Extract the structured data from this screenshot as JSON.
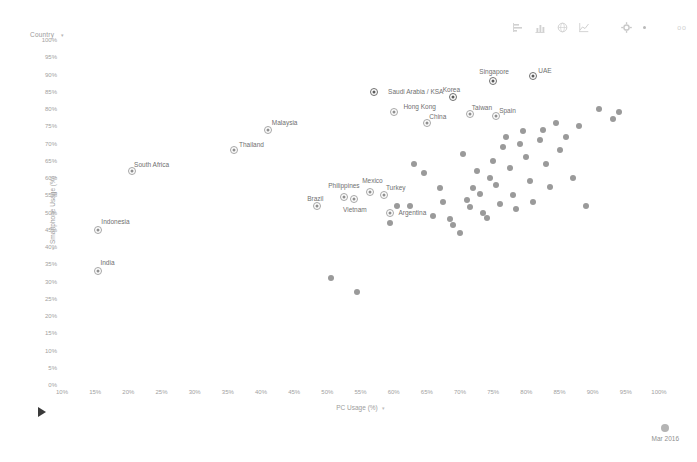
{
  "selector": {
    "label": "Country",
    "caret": "▾"
  },
  "toolbar": {
    "icons": [
      {
        "name": "bar-chart-icon",
        "glyph": "bar"
      },
      {
        "name": "column-chart-icon",
        "glyph": "column"
      },
      {
        "name": "globe-icon",
        "glyph": "globe"
      },
      {
        "name": "line-chart-icon",
        "glyph": "line"
      },
      {
        "name": "gear-icon",
        "glyph": "gear"
      }
    ],
    "menu_dot": "·",
    "corner_mark": "oo"
  },
  "playback": {
    "play_label": "play",
    "date_label": "Mar 2016"
  },
  "chart_data": {
    "type": "scatter",
    "title": "",
    "xlabel": "PC Usage (%)",
    "ylabel": "Smartphone Usage (%)",
    "xlim": [
      10,
      100
    ],
    "ylim": [
      0,
      100
    ],
    "xticks": [
      "10%",
      "15%",
      "20%",
      "25%",
      "30%",
      "35%",
      "40%",
      "45%",
      "50%",
      "55%",
      "60%",
      "65%",
      "70%",
      "75%",
      "80%",
      "85%",
      "90%",
      "95%",
      "100%"
    ],
    "yticks": [
      "100%",
      "95%",
      "90%",
      "85%",
      "80%",
      "75%",
      "70%",
      "65%",
      "60%",
      "55%",
      "50%",
      "45%",
      "40%",
      "35%",
      "30%",
      "25%",
      "20%",
      "15%",
      "10%",
      "5%",
      "0%"
    ],
    "grid": false,
    "legend": "none",
    "labeled_points": [
      {
        "label": "India",
        "x": 15.5,
        "y": 33,
        "label_dx": 9,
        "label_dy": -9
      },
      {
        "label": "Indonesia",
        "x": 15.5,
        "y": 45,
        "label_dx": 17,
        "label_dy": -9
      },
      {
        "label": "South Africa",
        "x": 20.5,
        "y": 62,
        "label_dx": 20,
        "label_dy": -7
      },
      {
        "label": "Thailand",
        "x": 36,
        "y": 68,
        "label_dx": 17,
        "label_dy": -6
      },
      {
        "label": "Malaysia",
        "x": 41,
        "y": 74,
        "label_dx": 17,
        "label_dy": -8
      },
      {
        "label": "Brazil",
        "x": 48.5,
        "y": 52,
        "label_dx": -2,
        "label_dy": -8
      },
      {
        "label": "Philippines",
        "x": 52.5,
        "y": 54.5,
        "label_dx": 0,
        "label_dy": -12
      },
      {
        "label": "Vietnam",
        "x": 54,
        "y": 54,
        "label_dx": 1,
        "label_dy": 10
      },
      {
        "label": "Mexico",
        "x": 56.5,
        "y": 56,
        "label_dx": 2,
        "label_dy": -12
      },
      {
        "label": "Turkey",
        "x": 58.5,
        "y": 55,
        "label_dx": 12,
        "label_dy": -8
      },
      {
        "label": "Argentina",
        "x": 59.5,
        "y": 50,
        "label_dx": 22,
        "label_dy": -1
      },
      {
        "label": "Saudi Arabia / KSA",
        "x": 57,
        "y": 85,
        "label_dx": 42,
        "label_dy": -1
      },
      {
        "label": "Hong Kong",
        "x": 60,
        "y": 79,
        "label_dx": 26,
        "label_dy": -6
      },
      {
        "label": "China",
        "x": 65,
        "y": 76,
        "label_dx": 11,
        "label_dy": -7
      },
      {
        "label": "Korea",
        "x": 69,
        "y": 83.5,
        "label_dx": -2,
        "label_dy": -8
      },
      {
        "label": "Taiwan",
        "x": 71.5,
        "y": 78.5,
        "label_dx": 12,
        "label_dy": -7
      },
      {
        "label": "Singapore",
        "x": 75,
        "y": 88,
        "label_dx": 1,
        "label_dy": -10
      },
      {
        "label": "Spain",
        "x": 75.5,
        "y": 78,
        "label_dx": 11,
        "label_dy": -6
      },
      {
        "label": "UAE",
        "x": 81,
        "y": 89.5,
        "label_dx": 12,
        "label_dy": -6
      }
    ],
    "unlabeled_points": [
      {
        "x": 50.5,
        "y": 31
      },
      {
        "x": 54.5,
        "y": 27
      },
      {
        "x": 59.5,
        "y": 47
      },
      {
        "x": 60.5,
        "y": 52
      },
      {
        "x": 62.5,
        "y": 52
      },
      {
        "x": 64.5,
        "y": 61.5
      },
      {
        "x": 67,
        "y": 57
      },
      {
        "x": 67.5,
        "y": 53
      },
      {
        "x": 68.5,
        "y": 48
      },
      {
        "x": 69,
        "y": 46.5
      },
      {
        "x": 70.5,
        "y": 67
      },
      {
        "x": 71,
        "y": 53.5
      },
      {
        "x": 71.5,
        "y": 51.5
      },
      {
        "x": 72,
        "y": 57
      },
      {
        "x": 72.5,
        "y": 62
      },
      {
        "x": 73,
        "y": 55.5
      },
      {
        "x": 73.5,
        "y": 50
      },
      {
        "x": 74,
        "y": 48.5
      },
      {
        "x": 74.5,
        "y": 60
      },
      {
        "x": 75,
        "y": 65
      },
      {
        "x": 75.5,
        "y": 58
      },
      {
        "x": 76,
        "y": 52.5
      },
      {
        "x": 76.5,
        "y": 69
      },
      {
        "x": 77,
        "y": 72
      },
      {
        "x": 77.5,
        "y": 63
      },
      {
        "x": 78,
        "y": 55
      },
      {
        "x": 78.5,
        "y": 51
      },
      {
        "x": 79,
        "y": 70
      },
      {
        "x": 79.5,
        "y": 73.5
      },
      {
        "x": 80,
        "y": 66
      },
      {
        "x": 80.5,
        "y": 59
      },
      {
        "x": 81,
        "y": 53
      },
      {
        "x": 82,
        "y": 71
      },
      {
        "x": 82.5,
        "y": 74
      },
      {
        "x": 83,
        "y": 64
      },
      {
        "x": 83.5,
        "y": 57.5
      },
      {
        "x": 84.5,
        "y": 76
      },
      {
        "x": 85,
        "y": 68
      },
      {
        "x": 86,
        "y": 72
      },
      {
        "x": 87,
        "y": 60
      },
      {
        "x": 88,
        "y": 75
      },
      {
        "x": 89,
        "y": 52
      },
      {
        "x": 91,
        "y": 80
      },
      {
        "x": 93,
        "y": 77
      },
      {
        "x": 94,
        "y": 79
      },
      {
        "x": 63,
        "y": 64
      },
      {
        "x": 66,
        "y": 49
      },
      {
        "x": 70,
        "y": 44
      }
    ]
  }
}
